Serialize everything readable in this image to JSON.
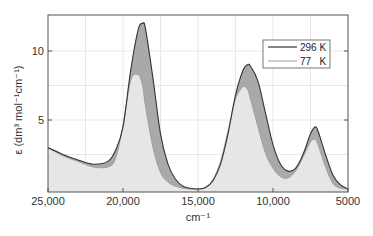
{
  "chart_data": {
    "type": "area",
    "title": "",
    "xlabel": "cm⁻¹",
    "ylabel": "ε (dm³ mol⁻¹cm⁻¹)",
    "xlim": [
      25000,
      5000
    ],
    "ylim": [
      0,
      12.5
    ],
    "x_reversed": true,
    "grid": true,
    "legend_position": "upper right",
    "x_ticks": [
      25000,
      20000,
      15000,
      10000,
      5000
    ],
    "x_tick_labels": [
      "25,000",
      "20,000",
      "15,000",
      "10,000",
      "5000"
    ],
    "y_ticks": [
      5,
      10
    ],
    "y_tick_labels": [
      "5",
      "10"
    ],
    "x": [
      25000,
      24000,
      23000,
      22000,
      21000,
      20500,
      20000,
      19500,
      19000,
      18700,
      18500,
      18000,
      17500,
      17000,
      16500,
      16000,
      15500,
      15000,
      14500,
      14000,
      13500,
      13000,
      12500,
      12000,
      11700,
      11500,
      11000,
      10500,
      10000,
      9500,
      9000,
      8500,
      8000,
      7500,
      7200,
      7000,
      6500,
      6000,
      5500,
      5000
    ],
    "series": [
      {
        "name": "296 K",
        "color": "#333333",
        "fill": "#a9a9a9",
        "values": [
          3.0,
          2.5,
          2.1,
          1.8,
          2.0,
          2.8,
          4.5,
          8.5,
          11.5,
          12.0,
          11.6,
          8.0,
          4.0,
          1.8,
          0.7,
          0.2,
          0.05,
          0.0,
          0.1,
          0.6,
          1.8,
          4.0,
          6.8,
          8.6,
          9.0,
          8.9,
          7.8,
          5.5,
          3.2,
          1.8,
          1.3,
          1.5,
          2.5,
          4.0,
          4.5,
          4.2,
          2.5,
          1.0,
          0.3,
          0.0
        ]
      },
      {
        "name": "77 K",
        "color": "#b0b0b0",
        "fill": "#e6e6e6",
        "values": [
          3.0,
          2.4,
          2.0,
          1.6,
          1.6,
          2.2,
          4.6,
          7.8,
          8.3,
          7.5,
          6.0,
          3.0,
          1.2,
          0.5,
          0.2,
          0.05,
          0.0,
          0.0,
          0.1,
          0.7,
          2.0,
          4.2,
          6.5,
          7.4,
          7.2,
          6.5,
          4.5,
          2.6,
          1.5,
          0.9,
          0.8,
          1.3,
          2.3,
          3.4,
          3.6,
          3.2,
          1.6,
          0.4,
          0.05,
          0.0
        ]
      }
    ]
  },
  "legend": {
    "items": [
      {
        "label": "296 K",
        "color": "#333333"
      },
      {
        "label": "77   K",
        "color": "#b0b0b0"
      }
    ]
  },
  "axes": {
    "x_title": "cm⁻¹",
    "y_title_prefix": "ε (dm³ mol⁻¹cm⁻¹)"
  }
}
